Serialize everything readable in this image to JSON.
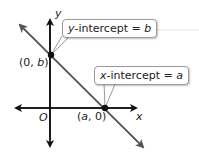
{
  "diagram": {
    "axes": {
      "x_label": "x",
      "y_label": "y",
      "origin_label": "O"
    },
    "points": [
      {
        "id": "y-intercept-point",
        "label_open": "(0, ",
        "label_var": "b",
        "label_close": ")"
      },
      {
        "id": "x-intercept-point",
        "label_open": "(",
        "label_var": "a",
        "label_close": ", 0)"
      }
    ],
    "callouts": [
      {
        "id": "y-intercept-callout",
        "prefix_var": "y",
        "text": "-intercept = ",
        "value_var": "b"
      },
      {
        "id": "x-intercept-callout",
        "prefix_var": "x",
        "text": "-intercept = ",
        "value_var": "a"
      }
    ],
    "colors": {
      "line": "#555555",
      "axis": "#111111",
      "point": "#111111",
      "callout_border": "#9a9a9a"
    }
  }
}
